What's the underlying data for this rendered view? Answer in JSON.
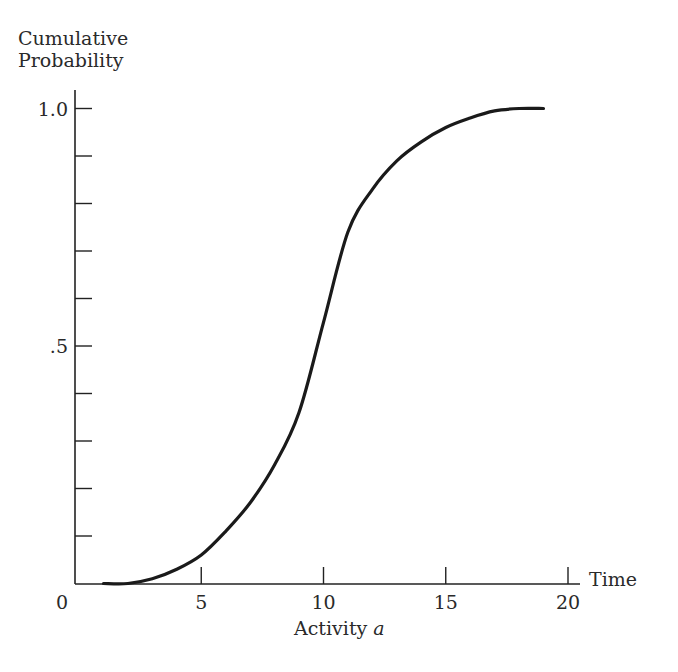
{
  "chart_data": {
    "type": "line",
    "title": "",
    "xlabel": "Activity a",
    "xlabel_main": "Activity ",
    "xlabel_var": "a",
    "x_axis_end_label": "Time",
    "ylabel": "Cumulative Probability",
    "ylabel_lines": [
      "Cumulative",
      "Probability"
    ],
    "xlim": [
      0,
      20
    ],
    "ylim": [
      0,
      1.0
    ],
    "x_ticks": [
      5,
      10,
      15,
      20
    ],
    "x_tick_labels": [
      "5",
      "10",
      "15",
      "20"
    ],
    "origin_label": "0",
    "y_ticks": [
      0.1,
      0.2,
      0.3,
      0.4,
      0.5,
      0.6,
      0.7,
      0.8,
      0.9,
      1.0
    ],
    "y_tick_labels": {
      "0.5": ".5",
      "1.0": "1.0"
    },
    "grid": false,
    "legend": null,
    "series": [
      {
        "name": "Cumulative probability of Activity a",
        "x": [
          1,
          2,
          3,
          4,
          5,
          6,
          7,
          8,
          9,
          10,
          11,
          12,
          13,
          14,
          15,
          16,
          17,
          18,
          19
        ],
        "values": [
          0,
          0,
          0.01,
          0.03,
          0.06,
          0.11,
          0.17,
          0.25,
          0.36,
          0.55,
          0.74,
          0.83,
          0.89,
          0.93,
          0.96,
          0.98,
          0.995,
          1.0,
          1.0
        ]
      }
    ]
  },
  "colors": {
    "ink": "#222222",
    "background": "#ffffff"
  }
}
